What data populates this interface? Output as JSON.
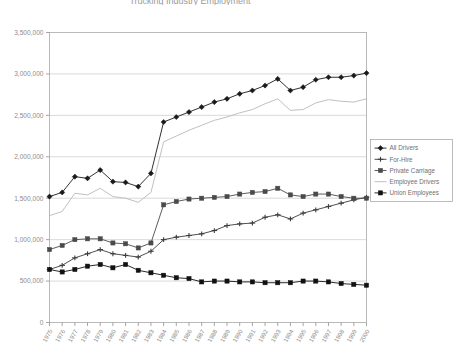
{
  "chart_data": {
    "type": "line",
    "title": "Trucking Industry Employment",
    "xlabel": "",
    "ylabel": "",
    "x": [
      1975,
      1976,
      1977,
      1978,
      1979,
      1980,
      1981,
      1982,
      1983,
      1984,
      1985,
      1986,
      1987,
      1988,
      1989,
      1990,
      1991,
      1992,
      1993,
      1994,
      1995,
      1996,
      1997,
      1998,
      1999,
      2000
    ],
    "xtick_labels": [
      "1975",
      "1976",
      "1977",
      "1978",
      "1979",
      "1980",
      "1981",
      "1982",
      "1983",
      "1984",
      "1985",
      "1986",
      "1987",
      "1988",
      "1989",
      "1990",
      "1991",
      "1992",
      "1993",
      "1994",
      "1995",
      "1996",
      "1997",
      "1998",
      "1999",
      "2000"
    ],
    "ylim": [
      0,
      3500000
    ],
    "ytick_values": [
      0,
      500000,
      1000000,
      1500000,
      2000000,
      2500000,
      3000000,
      3500000
    ],
    "ytick_labels": [
      "0",
      "500,000",
      "1,000,000",
      "1,500,000",
      "2,000,000",
      "2,500,000",
      "3,000,000",
      "3,500,000"
    ],
    "grid": true,
    "grid_axis": "y",
    "legend_position": "right",
    "series": [
      {
        "name": "All Drivers",
        "color": "#1a1a1a",
        "marker": "diamond",
        "values": [
          1520000,
          1570000,
          1760000,
          1740000,
          1840000,
          1700000,
          1690000,
          1640000,
          1800000,
          2420000,
          2480000,
          2540000,
          2600000,
          2660000,
          2700000,
          2760000,
          2800000,
          2860000,
          2940000,
          2800000,
          2840000,
          2930000,
          2960000,
          2960000,
          2980000,
          3010000
        ]
      },
      {
        "name": "For-Hire",
        "color": "#3c3c3c",
        "marker": "cross",
        "values": [
          640000,
          690000,
          780000,
          830000,
          880000,
          830000,
          810000,
          790000,
          860000,
          1000000,
          1030000,
          1050000,
          1070000,
          1110000,
          1170000,
          1190000,
          1200000,
          1270000,
          1300000,
          1250000,
          1320000,
          1360000,
          1400000,
          1440000,
          1480000,
          1510000
        ]
      },
      {
        "name": "Private Carriage",
        "color": "#4a4a4a",
        "marker": "square",
        "values": [
          880000,
          930000,
          1000000,
          1010000,
          1010000,
          960000,
          950000,
          900000,
          960000,
          1420000,
          1460000,
          1490000,
          1500000,
          1510000,
          1520000,
          1550000,
          1570000,
          1580000,
          1620000,
          1540000,
          1520000,
          1550000,
          1550000,
          1520000,
          1500000,
          1500000
        ]
      },
      {
        "name": "Employee Drivers",
        "color": "#c0c0c0",
        "marker": "none",
        "values": [
          1290000,
          1340000,
          1560000,
          1540000,
          1620000,
          1520000,
          1500000,
          1450000,
          1570000,
          2180000,
          2250000,
          2320000,
          2380000,
          2440000,
          2480000,
          2530000,
          2570000,
          2640000,
          2700000,
          2560000,
          2570000,
          2650000,
          2690000,
          2670000,
          2660000,
          2700000
        ]
      },
      {
        "name": "Union  Employees",
        "color": "#111111",
        "marker": "filled-square",
        "values": [
          640000,
          610000,
          640000,
          680000,
          700000,
          660000,
          700000,
          630000,
          600000,
          570000,
          540000,
          530000,
          490000,
          500000,
          500000,
          490000,
          490000,
          480000,
          480000,
          480000,
          500000,
          500000,
          490000,
          470000,
          460000,
          450000
        ]
      }
    ]
  },
  "legend": {
    "items": [
      {
        "label": "All Drivers"
      },
      {
        "label": "For-Hire"
      },
      {
        "label": "Private Carriage"
      },
      {
        "label": "Employee Drivers"
      },
      {
        "label": "Union  Employees"
      }
    ]
  }
}
